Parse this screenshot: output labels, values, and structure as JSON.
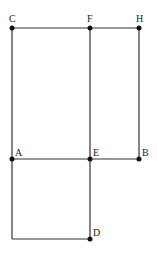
{
  "diagram": {
    "type": "geometry-figure",
    "points": [
      {
        "id": "C",
        "x": 12,
        "y": 28,
        "label": "C",
        "lx": 9,
        "ly": 22
      },
      {
        "id": "F",
        "x": 90,
        "y": 28,
        "label": "F",
        "lx": 87,
        "ly": 22
      },
      {
        "id": "H",
        "x": 139,
        "y": 28,
        "label": "H",
        "lx": 136,
        "ly": 22
      },
      {
        "id": "A",
        "x": 12,
        "y": 159,
        "label": "A",
        "lx": 15,
        "ly": 156
      },
      {
        "id": "E",
        "x": 90,
        "y": 159,
        "label": "E",
        "lx": 93,
        "ly": 156
      },
      {
        "id": "B",
        "x": 139,
        "y": 159,
        "label": "B",
        "lx": 142,
        "ly": 156
      },
      {
        "id": "D",
        "x": 90,
        "y": 239,
        "label": "D",
        "lx": 93,
        "ly": 236
      }
    ],
    "corner": {
      "x": 12,
      "y": 239
    },
    "segments": [
      [
        "C",
        "H"
      ],
      [
        "C",
        "A"
      ],
      [
        "F",
        "E"
      ],
      [
        "H",
        "B"
      ],
      [
        "A",
        "B"
      ],
      [
        "E",
        "D"
      ]
    ],
    "colors": {
      "line": "#333333",
      "point": "#111111",
      "label": "#222222"
    }
  }
}
